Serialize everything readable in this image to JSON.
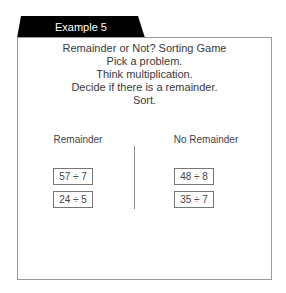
{
  "tab": {
    "label": "Example 5"
  },
  "instructions": {
    "lines": [
      "Remainder or Not? Sorting Game",
      "Pick a problem.",
      "Think multiplication.",
      "Decide if there is a remainder.",
      "Sort."
    ]
  },
  "columns": {
    "left": {
      "heading": "Remainder",
      "cards": [
        "57 ÷ 7",
        "24 ÷ 5"
      ]
    },
    "right": {
      "heading": "No Remainder",
      "cards": [
        "48 ÷ 8",
        "35 ÷ 7"
      ]
    }
  },
  "colors": {
    "tab_bg": "#000000",
    "border": "#9a9a9a",
    "text": "#3a3a3a"
  }
}
